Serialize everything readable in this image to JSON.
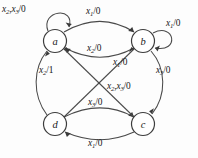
{
  "diagram": {
    "stroke_color": "#4a4a4a",
    "node_stroke_color": "#3d3d3d",
    "text_color": "#161616",
    "background": "#fdfdfd"
  },
  "nodes": [
    {
      "id": "a",
      "label": "a",
      "x": 55,
      "y": 41
    },
    {
      "id": "b",
      "label": "b",
      "x": 143,
      "y": 41
    },
    {
      "id": "d",
      "label": "d",
      "x": 55,
      "y": 124
    },
    {
      "id": "c",
      "label": "c",
      "x": 143,
      "y": 124
    }
  ],
  "edges": [
    {
      "id": "a-self",
      "from": "a",
      "to": "a",
      "inputs": "x2,x3",
      "output": "0",
      "label": "x2,x3/0"
    },
    {
      "id": "b-self",
      "from": "b",
      "to": "b",
      "inputs": "x1",
      "output": "0",
      "label": "x1/0"
    },
    {
      "id": "a-to-b",
      "from": "a",
      "to": "b",
      "inputs": "x1",
      "output": "0",
      "label": "x1/0"
    },
    {
      "id": "b-to-a",
      "from": "b",
      "to": "a",
      "inputs": "x2",
      "output": "0",
      "label": "x2/0"
    },
    {
      "id": "d-to-a",
      "from": "d",
      "to": "a",
      "inputs": "x2",
      "output": "1",
      "label": "x2/1"
    },
    {
      "id": "d-to-b",
      "from": "d",
      "to": "b",
      "inputs": "x1",
      "output": "0",
      "label": "x1/0"
    },
    {
      "id": "c-to-a",
      "from": "c",
      "to": "a",
      "inputs": "x2,x3",
      "output": "0",
      "label": "x2,x3/0"
    },
    {
      "id": "b-to-c",
      "from": "b",
      "to": "c",
      "inputs": "x3",
      "output": "0",
      "label": "x3/0"
    },
    {
      "id": "d-to-c",
      "from": "d",
      "to": "c",
      "inputs": "x3",
      "output": "0",
      "label": "x3/0"
    },
    {
      "id": "c-to-d",
      "from": "c",
      "to": "d",
      "inputs": "x1",
      "output": "0",
      "label": "x1/0"
    }
  ],
  "labels": {
    "a_self": {
      "var1": "x",
      "sub1": "2",
      "var2": "x",
      "sub2": "3",
      "out": "/0"
    },
    "b_self": {
      "var1": "x",
      "sub1": "1",
      "out": "/0"
    },
    "a_to_b": {
      "var1": "x",
      "sub1": "1",
      "out": "/0"
    },
    "b_to_a": {
      "var1": "x",
      "sub1": "2",
      "out": "/0"
    },
    "d_to_a": {
      "var1": "x",
      "sub1": "2",
      "out": "/1"
    },
    "d_to_b": {
      "var1": "x",
      "sub1": "1",
      "out": "/0"
    },
    "c_to_a": {
      "var1": "x",
      "sub1": "2",
      "var2": "x",
      "sub2": "3",
      "out": "/0"
    },
    "b_to_c": {
      "var1": "x",
      "sub1": "3",
      "out": "/0"
    },
    "d_to_c": {
      "var1": "x",
      "sub1": "3",
      "out": "/0"
    },
    "c_to_d": {
      "var1": "x",
      "sub1": "1",
      "out": "/0"
    }
  }
}
